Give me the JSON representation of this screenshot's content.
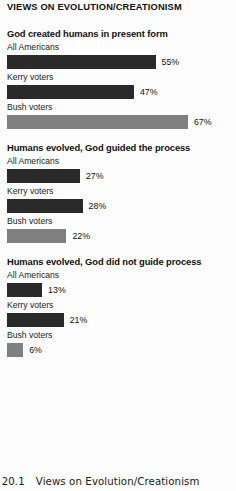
{
  "chart_data": {
    "type": "bar",
    "title": "VIEWS ON EVOLUTION/CREATIONISM",
    "xlabel": "",
    "ylabel": "",
    "xlim": [
      0,
      100
    ],
    "grid": false,
    "legend": "none",
    "orientation": "horizontal",
    "value_suffix": "%",
    "categories": [
      "All Americans",
      "Kerry voters",
      "Bush voters"
    ],
    "panels": [
      {
        "title": "God created humans in present form",
        "categories": [
          "All Americans",
          "Kerry voters",
          "Bush voters"
        ],
        "values": [
          55,
          47,
          67
        ],
        "labels": [
          "55%",
          "47%",
          "67%"
        ],
        "colors": [
          "#2a2a2a",
          "#2a2a2a",
          "#808080"
        ]
      },
      {
        "title": "Humans evolved, God guided the process",
        "categories": [
          "All Americans",
          "Kerry voters",
          "Bush voters"
        ],
        "values": [
          27,
          28,
          22
        ],
        "labels": [
          "27%",
          "28%",
          "22%"
        ],
        "colors": [
          "#2a2a2a",
          "#2a2a2a",
          "#808080"
        ]
      },
      {
        "title": "Humans evolved, God did not guide process",
        "categories": [
          "All Americans",
          "Kerry voters",
          "Bush voters"
        ],
        "values": [
          13,
          21,
          6
        ],
        "labels": [
          "13%",
          "21%",
          "6%"
        ],
        "colors": [
          "#2a2a2a",
          "#2a2a2a",
          "#808080"
        ]
      }
    ],
    "series": [
      {
        "name": "God created humans in present form",
        "values": [
          55,
          47,
          67
        ]
      },
      {
        "name": "Humans evolved, God guided the process",
        "values": [
          27,
          28,
          22
        ]
      },
      {
        "name": "Humans evolved, God did not guide process",
        "values": [
          13,
          21,
          6
        ]
      }
    ]
  },
  "colors": {
    "bar_dark": "#2a2a2a",
    "bar_light": "#808080",
    "background": "#fdfdfd",
    "text": "#111111"
  },
  "caption": {
    "number": "e 20.1",
    "text": "Views on Evolution/Creationism"
  }
}
